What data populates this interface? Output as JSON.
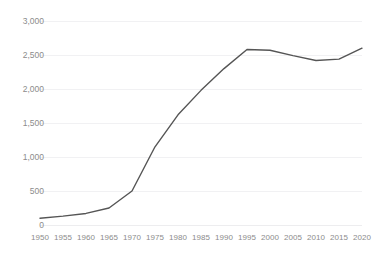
{
  "chart_data": {
    "type": "line",
    "title": "",
    "xlabel": "",
    "ylabel": "",
    "grid": true,
    "legend": false,
    "xlim": [
      1950,
      2020
    ],
    "ylim": [
      0,
      3000
    ],
    "yticks": [
      "3,000",
      "2,500",
      "2,000",
      "1,500",
      "1,000",
      "500",
      "0"
    ],
    "ytick_values": [
      3000,
      2500,
      2000,
      1500,
      1000,
      500,
      0
    ],
    "xticks": [
      "1950",
      "1955",
      "1960",
      "1965",
      "1970",
      "1975",
      "1980",
      "1985",
      "1990",
      "1995",
      "2000",
      "2005",
      "2010",
      "2015",
      "2020"
    ],
    "x": [
      1950,
      1955,
      1960,
      1965,
      1970,
      1975,
      1980,
      1985,
      1990,
      1995,
      2000,
      2005,
      2010,
      2015,
      2020
    ],
    "values": [
      100,
      130,
      170,
      250,
      500,
      1150,
      1620,
      1980,
      2300,
      2580,
      2570,
      2490,
      2420,
      2440,
      2600
    ],
    "series": [
      {
        "name": "",
        "values": [
          100,
          130,
          170,
          250,
          500,
          1150,
          1620,
          1980,
          2300,
          2580,
          2570,
          2490,
          2420,
          2440,
          2600
        ]
      }
    ],
    "line_color": "#555555",
    "grid_color": "#f1f1f3",
    "tick_color": "#8c8c8c"
  }
}
